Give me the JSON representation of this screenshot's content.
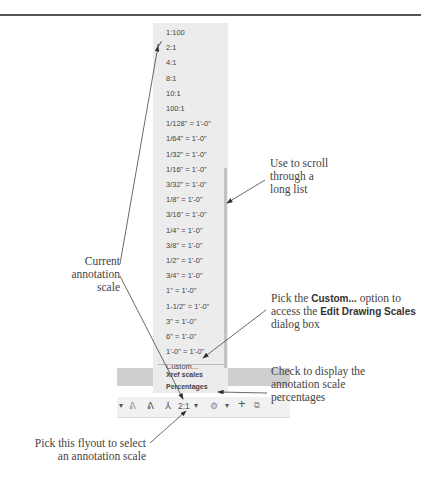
{
  "menu": {
    "items": [
      {
        "label": "1:100",
        "checked": false
      },
      {
        "label": "2:1",
        "checked": true
      },
      {
        "label": "4:1",
        "checked": false
      },
      {
        "label": "8:1",
        "checked": false
      },
      {
        "label": "10:1",
        "checked": false
      },
      {
        "label": "100:1",
        "checked": false
      },
      {
        "label": "1/128\" = 1'-0\"",
        "checked": false
      },
      {
        "label": "1/64\" = 1'-0\"",
        "checked": false
      },
      {
        "label": "1/32\" = 1'-0\"",
        "checked": false
      },
      {
        "label": "1/16\" = 1'-0\"",
        "checked": false
      },
      {
        "label": "3/32\" = 1'-0\"",
        "checked": false
      },
      {
        "label": "1/8\" = 1'-0\"",
        "checked": false
      },
      {
        "label": "3/16\" = 1'-0\"",
        "checked": false
      },
      {
        "label": "1/4\" = 1'-0\"",
        "checked": false
      },
      {
        "label": "3/8\" = 1'-0\"",
        "checked": false
      },
      {
        "label": "1/2\" = 1'-0\"",
        "checked": false
      },
      {
        "label": "3/4\" = 1'-0\"",
        "checked": false
      },
      {
        "label": "1\" = 1'-0\"",
        "checked": false
      },
      {
        "label": "1-1/2\" = 1'-0\"",
        "checked": false
      },
      {
        "label": "3\" = 1'-0\"",
        "checked": false
      },
      {
        "label": "6\" = 1'-0\"",
        "checked": false
      },
      {
        "label": "1'-0\" = 1'-0\"",
        "checked": false
      },
      {
        "label": "Custom...",
        "checked": false
      }
    ],
    "xref_scales": "Xref scales",
    "percentages": "Percentages",
    "check_mark": "✓"
  },
  "toolbar": {
    "current_scale": "2:1",
    "dropdown_arrow": "▾",
    "icons": [
      "annotation-visibility-icon",
      "auto-scale-icon",
      "annotation-scale-icon",
      "workspace-gear-icon",
      "plus-icon",
      "isolate-objects-icon"
    ]
  },
  "callouts": {
    "current_scale": [
      "Current",
      "annotation",
      "scale"
    ],
    "scroll": [
      "Use to scroll",
      "through a",
      "long list"
    ],
    "custom_pre": "Pick the ",
    "custom_bold": "Custom...",
    "custom_mid": " option to",
    "custom_line2_pre": "access the ",
    "custom_line2_bold": "Edit Drawing Scales",
    "custom_line3": "dialog box",
    "percentages": [
      "Check to display the",
      "annotation scale",
      "percentages"
    ],
    "flyout": [
      "Pick this flyout to select",
      "an annotation scale"
    ]
  }
}
